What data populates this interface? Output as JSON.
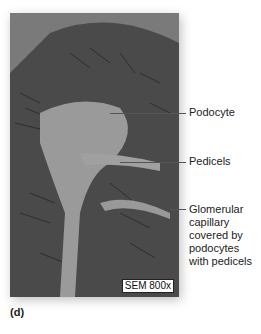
{
  "figure": {
    "panel_label": "(d)",
    "scale_bar": "SEM 800x",
    "labels": [
      {
        "text": "Podocyte"
      },
      {
        "text": "Pedicels"
      },
      {
        "text": "Glomerular capillary covered by podocytes with pedicels"
      }
    ]
  }
}
